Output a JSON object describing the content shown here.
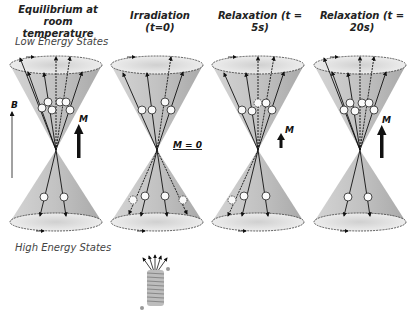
{
  "titles": [
    {
      "text": "Equilibrium at room temperature",
      "line1": "Equilibrium at room",
      "line2": "temperature"
    },
    {
      "text": "Irradiation (t=0)"
    },
    {
      "text": "Relaxation (t = 5s)"
    },
    {
      "text": "Relaxation (t = 20s)"
    }
  ],
  "labels": {
    "low_energy": "Low Energy States",
    "high_energy": "High Energy States",
    "field": "B",
    "magnetization": "M",
    "m_zero": "M = 0"
  },
  "panels": [
    {
      "name": "equilibrium",
      "cx": 56,
      "upper_spins": 5,
      "lower_spins": 2,
      "M_arrow": "large"
    },
    {
      "name": "irradiation",
      "cx": 157,
      "upper_spins": 4,
      "lower_spins": 4,
      "M_arrow": "none"
    },
    {
      "name": "relaxation-5s",
      "cx": 258,
      "upper_spins": 5,
      "lower_spins": 3,
      "M_arrow": "small"
    },
    {
      "name": "relaxation-20s",
      "cx": 360,
      "upper_spins": 6,
      "lower_spins": 2,
      "M_arrow": "large"
    }
  ],
  "colors": {
    "cone": "#c8c8c8",
    "cone_dark": "#a8a8a8",
    "ellipse": "#e4e4e4",
    "line": "#222222"
  }
}
